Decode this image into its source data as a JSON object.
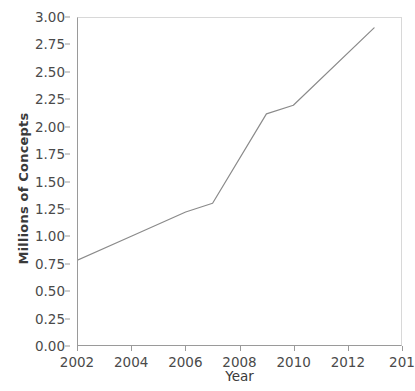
{
  "chart_data": {
    "type": "line",
    "title": "",
    "xlabel": "Year",
    "ylabel": "Millions of Concepts",
    "x": [
      2002,
      2004,
      2006,
      2007,
      2009,
      2010,
      2013
    ],
    "values": [
      0.78,
      1.0,
      1.22,
      1.3,
      2.12,
      2.2,
      2.91
    ],
    "series": [
      {
        "name": "Millions of Concepts",
        "x": [
          2002,
          2004,
          2006,
          2007,
          2009,
          2010,
          2013
        ],
        "values": [
          0.78,
          1.0,
          1.22,
          1.3,
          2.12,
          2.2,
          2.91
        ]
      }
    ],
    "xlim": [
      2002,
      2014
    ],
    "ylim": [
      0.0,
      3.0
    ],
    "xticks": [
      2002,
      2004,
      2006,
      2008,
      2010,
      2012,
      2014
    ],
    "xtick_labels": [
      "2002",
      "2004",
      "2006",
      "2008",
      "2010",
      "2012",
      "201"
    ],
    "yticks": [
      0.0,
      0.25,
      0.5,
      0.75,
      1.0,
      1.25,
      1.5,
      1.75,
      2.0,
      2.25,
      2.5,
      2.75,
      3.0
    ],
    "ytick_labels": [
      "0.00",
      "0.25",
      "0.50",
      "0.75",
      "1.00",
      "1.25",
      "1.50",
      "1.75",
      "2.00",
      "2.25",
      "2.50",
      "2.75",
      "3.00"
    ],
    "grid": false,
    "legend": null,
    "line_color": "#8a8a8a",
    "axis_color": "#9a9a9a",
    "text_color": "#4a4a4a",
    "background": "#ffffff"
  }
}
